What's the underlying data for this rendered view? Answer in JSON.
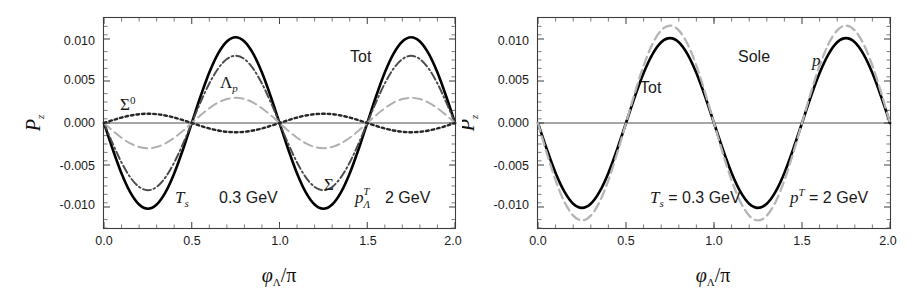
{
  "figure": {
    "panel_count": 2,
    "background_color": "#ffffff"
  },
  "chart_data": [
    {
      "type": "line",
      "panel": "left",
      "title": "",
      "xlabel": "φΛ/π",
      "ylabel": "Pz",
      "xlim": [
        0.0,
        2.0
      ],
      "ylim": [
        -0.0125,
        0.0125
      ],
      "grid": false,
      "legend_position": "inline-annotations",
      "x_ticks": [
        "0.0",
        "0.5",
        "1.0",
        "1.5",
        "2.0"
      ],
      "x_tick_values": [
        0.0,
        0.5,
        1.0,
        1.5,
        2.0
      ],
      "y_ticks": [
        "0.010",
        "0.005",
        "0.000",
        "-0.005",
        "-0.010"
      ],
      "y_tick_values": [
        0.01,
        0.005,
        0.0,
        -0.005,
        -0.01
      ],
      "x": [
        0.0,
        0.05,
        0.1,
        0.15,
        0.2,
        0.25,
        0.3,
        0.35,
        0.4,
        0.45,
        0.5,
        0.55,
        0.6,
        0.65,
        0.7,
        0.75,
        0.8,
        0.85,
        0.9,
        0.95,
        1.0,
        1.05,
        1.1,
        1.15,
        1.2,
        1.25,
        1.3,
        1.35,
        1.4,
        1.45,
        1.5,
        1.55,
        1.6,
        1.65,
        1.7,
        1.75,
        1.8,
        1.85,
        1.9,
        1.95,
        2.0
      ],
      "series": [
        {
          "name": "Tot",
          "label": "Tot",
          "style": "solid",
          "color": "#000000",
          "amplitude": 0.0102,
          "values": [
            0.0,
            -0.00315,
            -0.006,
            -0.00825,
            -0.0097,
            -0.0102,
            -0.0097,
            -0.00825,
            -0.006,
            -0.00315,
            0.0,
            0.00315,
            0.006,
            0.00825,
            0.0097,
            0.0102,
            0.0097,
            0.00825,
            0.006,
            0.00315,
            0.0,
            -0.00315,
            -0.006,
            -0.00825,
            -0.0097,
            -0.0102,
            -0.0097,
            -0.00825,
            -0.006,
            -0.00315,
            0.0,
            0.00315,
            0.006,
            0.00825,
            0.0097,
            0.0102,
            0.0097,
            0.00825,
            0.006,
            0.00315,
            0.0
          ]
        },
        {
          "name": "Sigma",
          "label": "Σ",
          "style": "dash-dot",
          "color": "#4a4a4a",
          "amplitude": 0.008,
          "values": [
            0.0,
            -0.00247,
            -0.0047,
            -0.00647,
            -0.00761,
            -0.008,
            -0.00761,
            -0.00647,
            -0.0047,
            -0.00247,
            0.0,
            0.00247,
            0.0047,
            0.00647,
            0.00761,
            0.008,
            0.00761,
            0.00647,
            0.0047,
            0.00247,
            0.0,
            -0.00247,
            -0.0047,
            -0.00647,
            -0.00761,
            -0.008,
            -0.00761,
            -0.00647,
            -0.0047,
            -0.00247,
            0.0,
            0.00247,
            0.0047,
            0.00647,
            0.00761,
            0.008,
            0.00761,
            0.00647,
            0.0047,
            0.00247,
            0.0
          ]
        },
        {
          "name": "Lambda_p",
          "label": "Λp",
          "style": "dashed",
          "color": "#b0b0b0",
          "amplitude": 0.003,
          "values": [
            0.0,
            -0.00093,
            -0.00176,
            -0.00243,
            -0.00285,
            -0.003,
            -0.00285,
            -0.00243,
            -0.00176,
            -0.00093,
            0.0,
            0.00093,
            0.00176,
            0.00243,
            0.00285,
            0.003,
            0.00285,
            0.00243,
            0.00176,
            0.00093,
            0.0,
            -0.00093,
            -0.00176,
            -0.00243,
            -0.00285,
            -0.003,
            -0.00285,
            -0.00243,
            -0.00176,
            -0.00093,
            0.0,
            0.00093,
            0.00176,
            0.00243,
            0.00285,
            0.003,
            0.00285,
            0.00243,
            0.00176,
            0.00093,
            0.0
          ]
        },
        {
          "name": "Sigma0",
          "label": "Σ⁰",
          "style": "dotted",
          "color": "#262626",
          "amplitude": 0.0011,
          "phase_inverted": true,
          "values": [
            0.0,
            0.00034,
            0.00065,
            0.00089,
            0.00105,
            0.0011,
            0.00105,
            0.00089,
            0.00065,
            0.00034,
            0.0,
            -0.00034,
            -0.00065,
            -0.00089,
            -0.00105,
            -0.0011,
            -0.00105,
            -0.00089,
            -0.00065,
            -0.00034,
            0.0,
            0.00034,
            0.00065,
            0.00089,
            0.00105,
            0.0011,
            0.00105,
            0.00089,
            0.00065,
            0.00034,
            0.0,
            -0.00034,
            -0.00065,
            -0.00089,
            -0.00105,
            -0.0011,
            -0.00105,
            -0.00089,
            -0.00065,
            -0.00034,
            0.0
          ]
        }
      ],
      "annotations": [
        {
          "id": "sigma0",
          "text": "Σ⁰",
          "base": "Σ",
          "sup": "0",
          "x": 0.135,
          "y": 0.0032
        },
        {
          "id": "lambdap",
          "text": "Λp",
          "base": "Λ",
          "sub": "p",
          "x": 0.665,
          "y": 0.0058
        },
        {
          "id": "tot",
          "text": "Tot",
          "x": 1.515,
          "y": 0.0079
        },
        {
          "id": "sigma",
          "text": "Σ",
          "x": 1.275,
          "y": -0.0052
        },
        {
          "id": "ts",
          "text": "Ts",
          "base": "T",
          "sub": "s",
          "x": 0.555,
          "y": -0.0079
        },
        {
          "id": "ts_val",
          "text": "0.3 GeV",
          "x": 0.9,
          "y": -0.0079
        },
        {
          "id": "pt",
          "text": "pΛT",
          "base": "p",
          "sub": "Λ",
          "sup": "T",
          "x": 1.455,
          "y": -0.0079
        },
        {
          "id": "pt_val",
          "text": "2 GeV",
          "x": 1.745,
          "y": -0.0079
        }
      ]
    },
    {
      "type": "line",
      "panel": "right",
      "title": "",
      "xlabel": "φΛ/π",
      "ylabel": "Pz",
      "xlim": [
        0.0,
        2.0
      ],
      "ylim": [
        -0.0125,
        0.0125
      ],
      "grid": false,
      "legend_position": "inline-annotations",
      "x_ticks": [
        "0.0",
        "0.5",
        "1.0",
        "1.5",
        "2.0"
      ],
      "x_tick_values": [
        0.0,
        0.5,
        1.0,
        1.5,
        2.0
      ],
      "y_ticks": [
        "0.010",
        "0.005",
        "0.000",
        "-0.005",
        "-0.010"
      ],
      "y_tick_values": [
        0.01,
        0.005,
        0.0,
        -0.005,
        -0.01
      ],
      "x": [
        0.0,
        0.05,
        0.1,
        0.15,
        0.2,
        0.25,
        0.3,
        0.35,
        0.4,
        0.45,
        0.5,
        0.55,
        0.6,
        0.65,
        0.7,
        0.75,
        0.8,
        0.85,
        0.9,
        0.95,
        1.0,
        1.05,
        1.1,
        1.15,
        1.2,
        1.25,
        1.3,
        1.35,
        1.4,
        1.45,
        1.5,
        1.55,
        1.6,
        1.65,
        1.7,
        1.75,
        1.8,
        1.85,
        1.9,
        1.95,
        2.0
      ],
      "series": [
        {
          "name": "Tot",
          "label": "Tot",
          "style": "solid",
          "color": "#000000",
          "amplitude": 0.0101,
          "values": [
            0.0,
            -0.00312,
            -0.00594,
            -0.00817,
            -0.00961,
            -0.0101,
            -0.00961,
            -0.00817,
            -0.00594,
            -0.00312,
            0.0,
            0.00312,
            0.00594,
            0.00817,
            0.00961,
            0.0101,
            0.00961,
            0.00817,
            0.00594,
            0.00312,
            0.0,
            -0.00312,
            -0.00594,
            -0.00817,
            -0.00961,
            -0.0101,
            -0.00961,
            -0.00817,
            -0.00594,
            -0.00312,
            0.0,
            0.00312,
            0.00594,
            0.00817,
            0.00961,
            0.0101,
            0.00961,
            0.00817,
            0.00594,
            0.00312,
            0.0
          ]
        },
        {
          "name": "Sole p",
          "label": "Sole p",
          "style": "dashed",
          "color": "#b5b5b5",
          "amplitude": 0.0116,
          "values": [
            0.0,
            -0.00358,
            -0.00682,
            -0.00939,
            -0.01103,
            -0.0116,
            -0.01103,
            -0.00939,
            -0.00682,
            -0.00358,
            0.0,
            0.00358,
            0.00682,
            0.00939,
            0.01103,
            0.0116,
            0.01103,
            0.00939,
            0.00682,
            0.00358,
            0.0,
            -0.00358,
            -0.00682,
            -0.00939,
            -0.01103,
            -0.0116,
            -0.01103,
            -0.00939,
            -0.00682,
            -0.00358,
            0.0,
            0.00358,
            0.00682,
            0.00939,
            0.01103,
            0.0116,
            0.01103,
            0.00939,
            0.00682,
            0.00358,
            0.0
          ]
        }
      ],
      "annotations": [
        {
          "id": "tot",
          "text": "Tot",
          "x": 0.585,
          "y": 0.0055
        },
        {
          "id": "sole",
          "text": "Sole",
          "x": 1.145,
          "y": 0.0085
        },
        {
          "id": "p",
          "text": "p",
          "x": 1.565,
          "y": 0.0082
        },
        {
          "id": "ts_eq",
          "text": "Ts = 0.3 GeV",
          "base": "T",
          "sub": "s",
          "rest": " = 0.3 GeV",
          "x": 0.78,
          "y": -0.0079
        },
        {
          "id": "pt_eq",
          "text": "pT = 2 GeV",
          "base": "p",
          "sup": "T",
          "rest": " = 2 GeV",
          "x": 1.565,
          "y": -0.0079
        }
      ]
    }
  ],
  "labels": {
    "y_axis_base": "P",
    "y_axis_sub": "z",
    "x_axis_phi": "φ",
    "x_axis_lambda": "Λ",
    "x_axis_slashpi": "/π",
    "tick_0_0": "0.0",
    "tick_0_5": "0.5",
    "tick_1_0": "1.0",
    "tick_1_5": "1.5",
    "tick_2_0": "2.0",
    "ytick_p010": "0.010",
    "ytick_p005": "0.005",
    "ytick_000": "0.000",
    "ytick_m005": "-0.005",
    "ytick_m010": "-0.010",
    "sigma0_base": "Σ",
    "sigma0_sup": "0",
    "lambda_base": "Λ",
    "lambda_sub": "p",
    "tot": "Tot",
    "sigma": "Σ",
    "T": "T",
    "s": "s",
    "gev_03": "0.3 GeV",
    "p": "p",
    "Lam": "Λ",
    "T_sup": "T",
    "gev_2": "2 GeV",
    "sole": "Sole",
    "eq_03gev": " = 0.3 GeV",
    "eq_2gev": " = 2 GeV"
  },
  "colors": {
    "tot": "#000000",
    "sigma": "#4a4a4a",
    "lambda_p": "#b0b0b0",
    "sigma0": "#262626",
    "sole_p": "#b5b5b5",
    "frame": "#3d3d3d",
    "text": "#1a1a1a"
  }
}
